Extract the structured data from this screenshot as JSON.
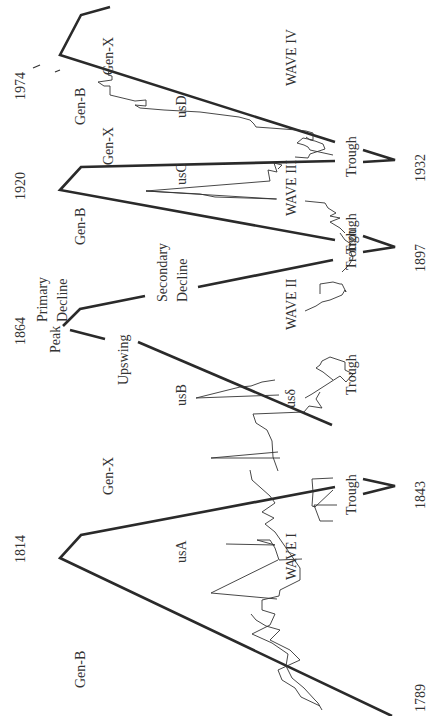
{
  "diagram": {
    "orientation": "rotated -90deg",
    "years": {
      "y1789": "1789",
      "y1814": "1814",
      "y1843": "1843",
      "y1864": "1864",
      "y1897": "1897",
      "y1920": "1920",
      "y1932": "1932",
      "y1974": "1974"
    },
    "waves": {
      "w1": "WAVE I",
      "w2": "WAVE II",
      "w3": "WAVE III",
      "w4": "WAVE IV"
    },
    "series_labels": {
      "usA": "usA",
      "usB": "usB",
      "usC": "usC",
      "usD": "usD",
      "us_delta": "usδ"
    },
    "phase_labels": {
      "peak": "Peak",
      "upswing": "Upswing",
      "primary": "Primary",
      "decline1": "Decline",
      "secondary": "Secondary",
      "decline2": "Decline",
      "trough": "Trough"
    },
    "generation_labels": {
      "genB": "Gen-B",
      "genX": "Gen-X"
    },
    "colors": {
      "line": "#2a2a2a",
      "text": "#333333",
      "background": "#ffffff"
    }
  }
}
